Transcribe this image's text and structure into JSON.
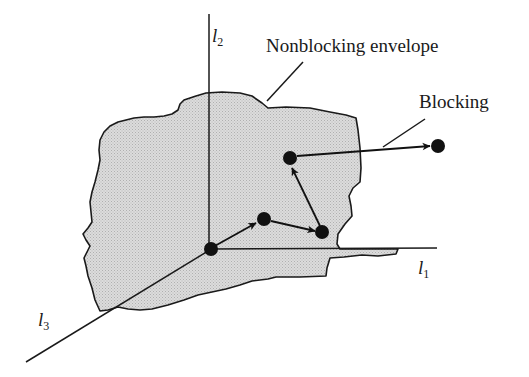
{
  "figure": {
    "type": "diagram",
    "background_color": "#ffffff",
    "line_color": "#1a1a1a",
    "envelope_fill": "#d4d4d4",
    "envelope_stroke": "#1a1a1a",
    "dot_color": "#111111"
  },
  "axes": [
    {
      "id": "l1",
      "base": "l",
      "subscript": "1",
      "label": "l1",
      "x": 418,
      "y": 258,
      "orientation": "horizontal-right"
    },
    {
      "id": "l2",
      "base": "l",
      "subscript": "2",
      "label": "l2",
      "x": 212,
      "y": 26,
      "orientation": "vertical-up"
    },
    {
      "id": "l3",
      "base": "l",
      "subscript": "3",
      "label": "l3",
      "x": 38,
      "y": 310,
      "orientation": "diagonal-lower-left"
    }
  ],
  "annotations": [
    {
      "id": "nonblocking-envelope",
      "text": "Nonblocking envelope",
      "x": 266,
      "y": 36
    },
    {
      "id": "blocking",
      "text": "Blocking",
      "x": 419,
      "y": 92
    }
  ],
  "points": [
    {
      "id": "origin",
      "x": 211,
      "y": 249,
      "r": 7
    },
    {
      "id": "state-1",
      "x": 264,
      "y": 219,
      "r": 7
    },
    {
      "id": "state-2",
      "x": 322,
      "y": 232,
      "r": 7
    },
    {
      "id": "state-3",
      "x": 290,
      "y": 158,
      "r": 7
    },
    {
      "id": "blocking-state",
      "x": 438,
      "y": 146,
      "r": 7
    }
  ],
  "trajectory": [
    {
      "id": "origin-to-state-1",
      "from": "origin",
      "to": "state-1"
    },
    {
      "id": "state-1-to-state-2",
      "from": "state-1",
      "to": "state-2"
    },
    {
      "id": "state-2-to-state-3",
      "from": "state-2",
      "to": "state-3"
    },
    {
      "id": "state-3-to-blocking",
      "from": "state-3",
      "to": "blocking-state"
    }
  ]
}
